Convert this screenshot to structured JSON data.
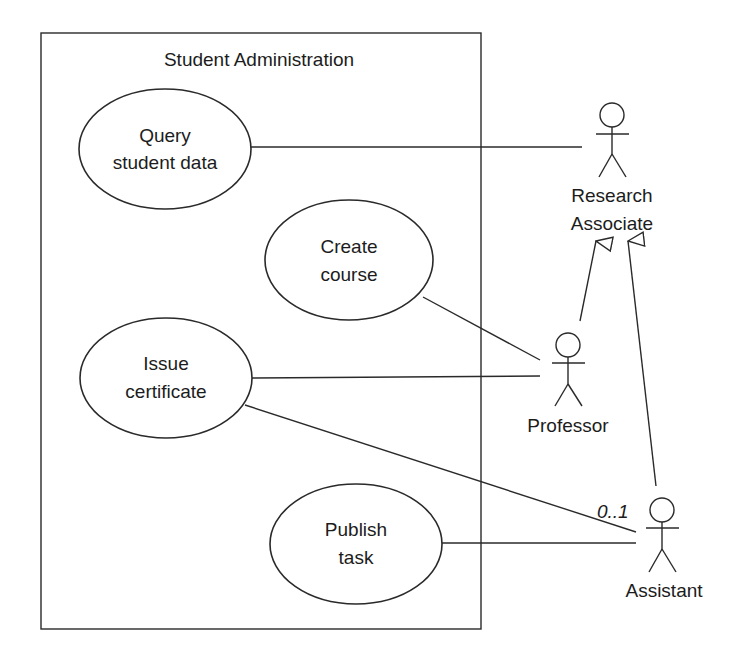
{
  "system": {
    "title": "Student Administration"
  },
  "use_cases": [
    {
      "id": "query",
      "line1": "Query",
      "line2": "student data"
    },
    {
      "id": "create",
      "line1": "Create",
      "line2": "course"
    },
    {
      "id": "issue",
      "line1": "Issue",
      "line2": "certificate"
    },
    {
      "id": "publish",
      "line1": "Publish",
      "line2": "task"
    }
  ],
  "actors": [
    {
      "id": "research",
      "line1": "Research",
      "line2": "Associate"
    },
    {
      "id": "professor",
      "line1": "Professor"
    },
    {
      "id": "assistant",
      "line1": "Assistant"
    }
  ],
  "associations": [
    {
      "from": "query",
      "to": "research"
    },
    {
      "from": "create",
      "to": "professor"
    },
    {
      "from": "issue",
      "to": "professor"
    },
    {
      "from": "issue",
      "to": "assistant",
      "multiplicity": "0..1"
    },
    {
      "from": "publish",
      "to": "assistant"
    }
  ],
  "generalizations": [
    {
      "child": "professor",
      "parent": "research"
    },
    {
      "child": "assistant",
      "parent": "research"
    }
  ]
}
